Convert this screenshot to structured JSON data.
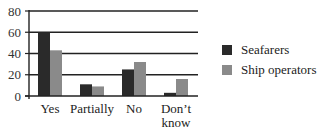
{
  "chart_data": {
    "type": "bar",
    "title": "",
    "xlabel": "",
    "ylabel": "",
    "ylim": [
      0,
      80
    ],
    "yticks": [
      0,
      20,
      40,
      60,
      80
    ],
    "grid": true,
    "legend_position": "right",
    "categories": [
      "Yes",
      "Partially",
      "No",
      "Don't know"
    ],
    "category_lines": [
      [
        "Yes"
      ],
      [
        "Partially"
      ],
      [
        "No"
      ],
      [
        "Don’t",
        "know"
      ]
    ],
    "series": [
      {
        "name": "Seafarers",
        "color": "#2a2a2a",
        "values": [
          60,
          11,
          25,
          3
        ]
      },
      {
        "name": "Ship operators",
        "color": "#8a8a8a",
        "values": [
          43,
          9,
          32,
          16
        ]
      }
    ]
  },
  "legend": {
    "items": [
      {
        "label": "Seafarers",
        "color": "#2a2a2a"
      },
      {
        "label": "Ship operators",
        "color": "#8a8a8a"
      }
    ]
  }
}
